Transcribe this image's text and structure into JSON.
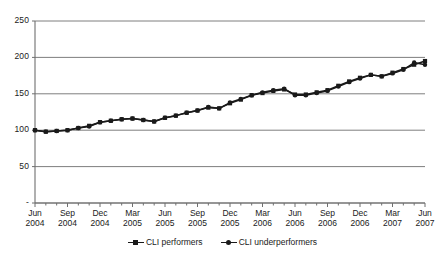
{
  "chart_data": {
    "type": "line",
    "title": "",
    "subtitle": "",
    "xlabel": "",
    "ylabel": "",
    "ylim": [
      0,
      250
    ],
    "yticks": [
      "-",
      "50",
      "100",
      "150",
      "200",
      "250"
    ],
    "ytick_values": [
      0,
      50,
      100,
      150,
      200,
      250
    ],
    "grid": true,
    "legend_position": "bottom",
    "x_tick_labels": [
      {
        "month": "Jun",
        "year": "2004"
      },
      {
        "month": "Sep",
        "year": "2004"
      },
      {
        "month": "Dec",
        "year": "2004"
      },
      {
        "month": "Mar",
        "year": "2005"
      },
      {
        "month": "Jun",
        "year": "2005"
      },
      {
        "month": "Sep",
        "year": "2005"
      },
      {
        "month": "Dec",
        "year": "2005"
      },
      {
        "month": "Mar",
        "year": "2006"
      },
      {
        "month": "Jun",
        "year": "2006"
      },
      {
        "month": "Sep",
        "year": "2006"
      },
      {
        "month": "Dec",
        "year": "2006"
      },
      {
        "month": "Mar",
        "year": "2007"
      },
      {
        "month": "Jun",
        "year": "2007"
      }
    ],
    "x": [
      "Jun 2004",
      "Jul 2004",
      "Aug 2004",
      "Sep 2004",
      "Oct 2004",
      "Nov 2004",
      "Dec 2004",
      "Jan 2005",
      "Feb 2005",
      "Mar 2005",
      "Apr 2005",
      "May 2005",
      "Jun 2005",
      "Jul 2005",
      "Aug 2005",
      "Sep 2005",
      "Oct 2005",
      "Nov 2005",
      "Dec 2005",
      "Jan 2006",
      "Feb 2006",
      "Mar 2006",
      "Apr 2006",
      "May 2006",
      "Jun 2006",
      "Jul 2006",
      "Aug 2006",
      "Sep 2006",
      "Oct 2006",
      "Nov 2006",
      "Dec 2006",
      "Jan 2007",
      "Feb 2007",
      "Mar 2007",
      "Apr 2007",
      "May 2007",
      "Jun 2007"
    ],
    "series": [
      {
        "name": "CLI performers",
        "marker": "square",
        "color": "#1a1a1a",
        "values": [
          100,
          98,
          99,
          100,
          103,
          106,
          111,
          113,
          115,
          116,
          114,
          112,
          117,
          120,
          124,
          127,
          131,
          130,
          137,
          142,
          148,
          151,
          154,
          156,
          149,
          149,
          152,
          155,
          161,
          167,
          172,
          176,
          174,
          179,
          184,
          190,
          195
        ]
      },
      {
        "name": "CLI underperformers",
        "marker": "circle",
        "color": "#1a1a1a",
        "values": [
          100,
          98,
          99,
          100,
          103,
          105,
          111,
          113,
          115,
          116,
          114,
          112,
          117,
          120,
          124,
          127,
          132,
          130,
          138,
          143,
          148,
          152,
          155,
          157,
          148,
          148,
          151,
          154,
          160,
          166,
          171,
          176,
          174,
          178,
          183,
          193,
          190
        ]
      }
    ],
    "axes_geometry": {
      "plot_left": 35,
      "plot_right": 425,
      "plot_top": 21,
      "plot_bottom": 203
    }
  },
  "legend": {
    "entries": [
      {
        "label": "CLI performers",
        "marker": "square"
      },
      {
        "label": "CLI underperformers",
        "marker": "circle"
      }
    ]
  }
}
